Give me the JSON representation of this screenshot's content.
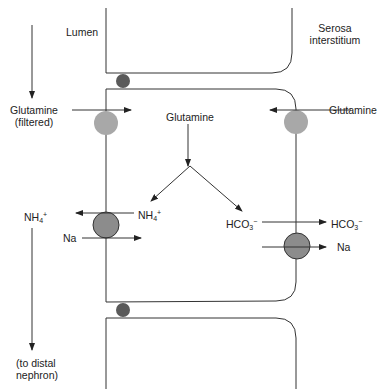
{
  "labels": {
    "lumen": "Lumen",
    "serosa_line1": "Serosa",
    "serosa_line2": "interstitium",
    "glutamine_filtered_line1": "Glutamine",
    "glutamine_filtered_line2": "(filtered)",
    "glutamine_center": "Glutamine",
    "glutamine_right": "Glutamine",
    "nh4_cell_base": "NH",
    "nh4_cell_sub": "4",
    "nh4_cell_sup": "+",
    "nh4_lumen_base": "NH",
    "nh4_lumen_sub": "4",
    "nh4_lumen_sup": "+",
    "na_lumen": "Na",
    "hco3_cell_base": "HCO",
    "hco3_cell_sub": "3",
    "hco3_cell_sup": "−",
    "hco3_out_base": "HCO",
    "hco3_out_sub": "3",
    "hco3_out_sup": "−",
    "na_out": "Na",
    "to_distal_line1": "(to distal",
    "to_distal_line2": "nephron)"
  },
  "colors": {
    "line": "#333333",
    "junction": "#5a5a5a",
    "transporter_light": "#a8a8a8",
    "transporter_dark": "#8c8c8c",
    "text": "#222222"
  }
}
